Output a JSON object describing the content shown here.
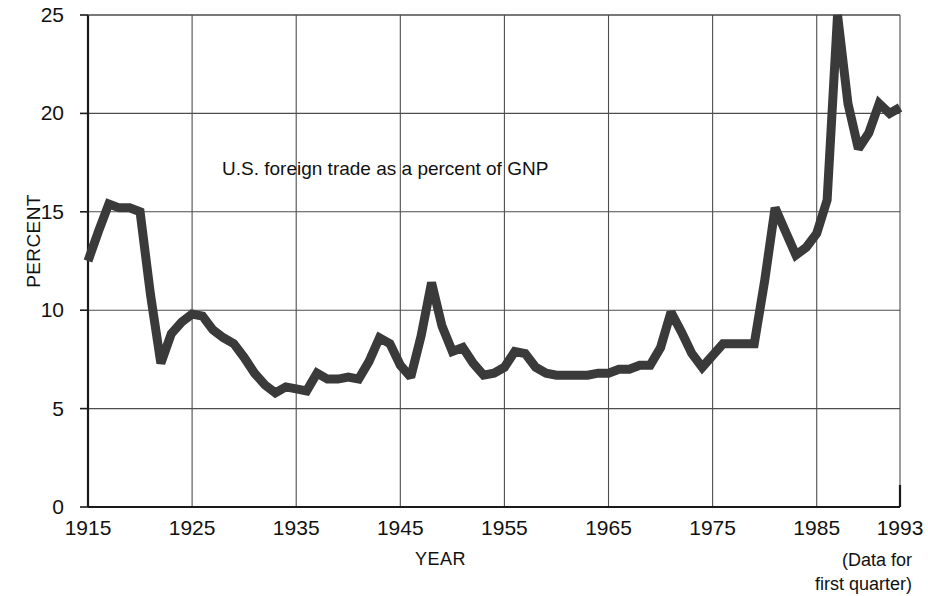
{
  "chart_data": {
    "type": "line",
    "title": "",
    "annotation": "U.S. foreign trade as a percent of GNP",
    "xlabel": "YEAR",
    "ylabel": "PERCENT",
    "footnote": [
      "(Data for",
      "first quarter)"
    ],
    "xlim": [
      1915,
      1993
    ],
    "ylim": [
      0,
      25
    ],
    "grid": true,
    "legend": "none",
    "xticks": [
      1915,
      1925,
      1935,
      1945,
      1955,
      1965,
      1975,
      1985,
      1993
    ],
    "xtick_labels": [
      "1915",
      "1925",
      "1935",
      "1945",
      "1955",
      "1965",
      "1975",
      "1985",
      "1993"
    ],
    "yticks": [
      0,
      5,
      10,
      15,
      20,
      25
    ],
    "ytick_labels": [
      "0",
      "5",
      "10",
      "15",
      "20",
      "25"
    ],
    "gridlines_x": [
      1915,
      1925,
      1935,
      1945,
      1955,
      1965,
      1975,
      1985
    ],
    "gridlines_y": [
      5,
      10,
      15,
      20,
      25
    ],
    "line_color": "#3a3a3a",
    "line_width_px": 9,
    "axis_color": "#1a1a1a",
    "grid_color": "#4d4d4d",
    "background": "#ffffff",
    "x": [
      1915,
      1916,
      1917,
      1918,
      1919,
      1920,
      1921,
      1922,
      1923,
      1924,
      1925,
      1926,
      1927,
      1928,
      1929,
      1930,
      1931,
      1932,
      1933,
      1934,
      1935,
      1936,
      1937,
      1938,
      1939,
      1940,
      1941,
      1942,
      1943,
      1944,
      1945,
      1946,
      1947,
      1948,
      1949,
      1950,
      1951,
      1952,
      1953,
      1954,
      1955,
      1956,
      1957,
      1958,
      1959,
      1960,
      1961,
      1962,
      1963,
      1964,
      1965,
      1966,
      1967,
      1968,
      1969,
      1970,
      1971,
      1972,
      1973,
      1974,
      1975,
      1976,
      1977,
      1978,
      1979,
      1980,
      1981,
      1982,
      1983,
      1984,
      1985,
      1986,
      1987,
      1988,
      1989,
      1990,
      1991,
      1992,
      1993
    ],
    "y": [
      12.5,
      14.0,
      15.4,
      15.2,
      15.2,
      15.0,
      10.8,
      7.3,
      8.8,
      9.4,
      9.8,
      9.7,
      9.0,
      8.6,
      8.3,
      7.6,
      6.8,
      6.2,
      5.8,
      6.1,
      6.0,
      5.9,
      6.8,
      6.5,
      6.5,
      6.6,
      6.5,
      7.4,
      8.6,
      8.3,
      7.2,
      6.6,
      8.7,
      11.4,
      9.2,
      7.9,
      8.1,
      7.3,
      6.7,
      6.8,
      7.1,
      7.9,
      7.8,
      7.1,
      6.8,
      6.7,
      6.7,
      6.7,
      6.7,
      6.8,
      6.8,
      7.0,
      7.0,
      7.2,
      7.2,
      8.1,
      9.9,
      8.9,
      7.8,
      7.1,
      7.7,
      8.3,
      8.3,
      8.3,
      8.3,
      11.5,
      15.2,
      14.0,
      12.8,
      13.2,
      13.9,
      15.6,
      25.0,
      20.5,
      18.2,
      19.0,
      20.5,
      20.0,
      20.3,
      20.6,
      21.0,
      22.2,
      23.0,
      25.0,
      23.5,
      21.2,
      21.0,
      22.0
    ],
    "notable_points": [
      {
        "year": 1917,
        "value": 15.4,
        "note": "WWI peak"
      },
      {
        "year": 1922,
        "value": 7.3,
        "note": "post-war trough"
      },
      {
        "year": 1926,
        "value": 9.8,
        "note": "1920s peak"
      },
      {
        "year": 1934,
        "value": 5.8,
        "note": "Depression low"
      },
      {
        "year": 1948,
        "value": 11.4,
        "note": "post-WWII peak"
      },
      {
        "year": 1971,
        "value": 9.9,
        "note": "mid-1960s peak"
      },
      {
        "year": 1974,
        "value": 15.2,
        "note": "oil shock"
      },
      {
        "year": 1980,
        "value": 25.0,
        "note": "peak 25"
      },
      {
        "year": 1990,
        "value": 25.0,
        "note": "peak 25"
      },
      {
        "year": 1993,
        "value": 22.0,
        "note": "first quarter"
      }
    ]
  },
  "geometry": {
    "plot_left": 88,
    "plot_right": 900,
    "plot_top": 15,
    "plot_bottom": 507
  }
}
